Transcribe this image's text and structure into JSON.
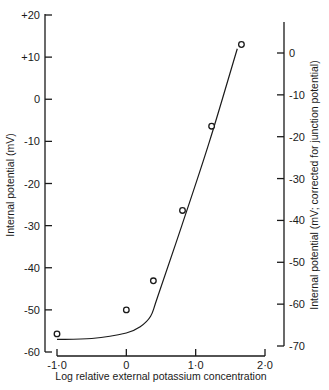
{
  "chart_data": {
    "type": "scatter",
    "title": "",
    "xlabel": "Log relative external potassium concentration",
    "ylabel": "Internal potential (mV)",
    "ylabel_right": "Internal potential (mV; corrected for junction potential)",
    "xlim": [
      -1.0,
      2.0
    ],
    "ylim": [
      -60,
      20
    ],
    "ylim_right": [
      -70,
      0
    ],
    "grid": false,
    "legend": null,
    "x_ticks": [
      "-1·0",
      "0",
      "1·0",
      "2·0"
    ],
    "x_tick_values": [
      -1.0,
      0,
      1.0,
      2.0
    ],
    "y_ticks": [
      "+20",
      "+10",
      "0",
      "-10",
      "-20",
      "-30",
      "-40",
      "-50",
      "-60"
    ],
    "y_tick_values": [
      20,
      10,
      0,
      -10,
      -20,
      -30,
      -40,
      -50,
      -60
    ],
    "y_right_ticks": [
      "0",
      "-10",
      "-20",
      "-30",
      "-40",
      "-50",
      "-60",
      "-70"
    ],
    "y_right_tick_values": [
      0,
      -10,
      -20,
      -30,
      -40,
      -50,
      -60,
      -70
    ],
    "series": [
      {
        "name": "measured points",
        "marker": "open-circle",
        "x": [
          -1.0,
          0.0,
          0.39,
          0.81,
          1.23,
          1.66
        ],
        "y": [
          -55.7,
          -50.0,
          -43.1,
          -26.4,
          -6.4,
          13.0
        ]
      },
      {
        "name": "fitted curve",
        "marker": "line",
        "x": [
          -1.0,
          -0.5,
          0.0,
          0.2,
          0.35,
          0.45,
          0.8,
          1.2,
          1.6
        ],
        "y": [
          -57.0,
          -56.8,
          -55.5,
          -54.0,
          -51.5,
          -47.0,
          -30.0,
          -10.0,
          12.0
        ]
      }
    ]
  }
}
